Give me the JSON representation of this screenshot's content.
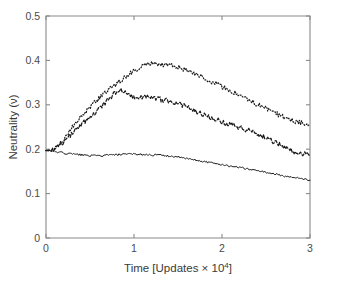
{
  "figure": {
    "width": 338,
    "height": 281,
    "background": "#ffffff",
    "foreground": "#1a1a1a",
    "axis_color": "#8a8a8a"
  },
  "chart_data": {
    "type": "line",
    "title": "",
    "xlabel": "Time [Updates × 10⁴]",
    "ylabel": "Neutrality (ν)",
    "xlim": [
      0,
      3
    ],
    "ylim": [
      0,
      0.5
    ],
    "xticks": [
      0,
      1,
      2,
      3
    ],
    "xticklabels": [
      "0",
      "1",
      "2",
      "3"
    ],
    "yticks": [
      0,
      0.1,
      0.2,
      0.3,
      0.4,
      0.5
    ],
    "yticklabels": [
      "0",
      "0.1",
      "0.2",
      "0.3",
      "0.4",
      "0.5"
    ],
    "grid": false,
    "legend": null,
    "legend_position": "none",
    "box": true,
    "x": [
      0.0,
      0.06,
      0.12,
      0.18,
      0.24,
      0.3,
      0.36,
      0.42,
      0.48,
      0.54,
      0.6,
      0.66,
      0.72,
      0.78,
      0.84,
      0.9,
      0.96,
      1.02,
      1.08,
      1.14,
      1.2,
      1.26,
      1.32,
      1.38,
      1.44,
      1.5,
      1.56,
      1.62,
      1.68,
      1.74,
      1.8,
      1.86,
      1.92,
      1.98,
      2.04,
      2.1,
      2.16,
      2.22,
      2.28,
      2.34,
      2.4,
      2.46,
      2.52,
      2.58,
      2.64,
      2.7,
      2.76,
      2.82,
      2.88,
      2.94,
      3.0
    ],
    "series": [
      {
        "name": "dotted-series",
        "linestyle": "dotted",
        "color": "#1a1a1a",
        "values": [
          0.197,
          0.199,
          0.205,
          0.217,
          0.233,
          0.249,
          0.264,
          0.278,
          0.291,
          0.303,
          0.314,
          0.325,
          0.335,
          0.344,
          0.353,
          0.362,
          0.371,
          0.379,
          0.387,
          0.392,
          0.394,
          0.393,
          0.391,
          0.389,
          0.387,
          0.384,
          0.381,
          0.377,
          0.372,
          0.367,
          0.361,
          0.355,
          0.349,
          0.343,
          0.337,
          0.331,
          0.325,
          0.319,
          0.313,
          0.307,
          0.301,
          0.295,
          0.289,
          0.283,
          0.278,
          0.273,
          0.268,
          0.264,
          0.261,
          0.258,
          0.256
        ]
      },
      {
        "name": "dashed-series",
        "linestyle": "dashed",
        "color": "#1a1a1a",
        "values": [
          0.197,
          0.198,
          0.202,
          0.211,
          0.223,
          0.236,
          0.248,
          0.259,
          0.268,
          0.278,
          0.29,
          0.302,
          0.314,
          0.327,
          0.334,
          0.33,
          0.322,
          0.317,
          0.316,
          0.318,
          0.319,
          0.315,
          0.311,
          0.309,
          0.307,
          0.303,
          0.298,
          0.293,
          0.288,
          0.283,
          0.278,
          0.273,
          0.268,
          0.263,
          0.259,
          0.255,
          0.251,
          0.248,
          0.244,
          0.24,
          0.235,
          0.23,
          0.224,
          0.218,
          0.212,
          0.206,
          0.2,
          0.195,
          0.191,
          0.189,
          0.187
        ]
      },
      {
        "name": "solid-series",
        "linestyle": "solid",
        "color": "#1a1a1a",
        "values": [
          0.197,
          0.196,
          0.194,
          0.192,
          0.19,
          0.189,
          0.188,
          0.187,
          0.186,
          0.185,
          0.185,
          0.186,
          0.187,
          0.187,
          0.188,
          0.188,
          0.189,
          0.189,
          0.188,
          0.188,
          0.187,
          0.187,
          0.186,
          0.185,
          0.184,
          0.182,
          0.18,
          0.178,
          0.176,
          0.174,
          0.172,
          0.17,
          0.168,
          0.166,
          0.164,
          0.162,
          0.16,
          0.158,
          0.156,
          0.154,
          0.152,
          0.15,
          0.147,
          0.145,
          0.142,
          0.14,
          0.138,
          0.136,
          0.134,
          0.132,
          0.13
        ]
      }
    ]
  }
}
